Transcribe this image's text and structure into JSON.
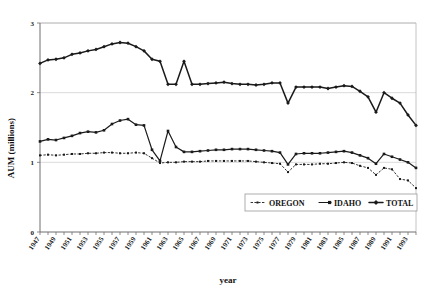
{
  "chart_data": {
    "type": "line",
    "title": "",
    "xlabel": "year",
    "ylabel": "AUM (millions)",
    "ylim": [
      0,
      3
    ],
    "yticks": [
      0,
      1,
      2,
      3
    ],
    "ytick_labels": [
      "0",
      "1",
      "2",
      "3"
    ],
    "grid": true,
    "legend_position": "inside-bottom-center",
    "x": [
      1947,
      1948,
      1949,
      1950,
      1951,
      1952,
      1953,
      1954,
      1955,
      1956,
      1957,
      1958,
      1959,
      1960,
      1961,
      1962,
      1963,
      1964,
      1965,
      1966,
      1967,
      1968,
      1969,
      1970,
      1971,
      1972,
      1973,
      1974,
      1975,
      1976,
      1977,
      1978,
      1979,
      1980,
      1981,
      1982,
      1983,
      1984,
      1985,
      1986,
      1987,
      1988,
      1989,
      1990,
      1991,
      1992,
      1993,
      1994
    ],
    "xtick_labels": [
      "1947",
      "1949",
      "1951",
      "1953",
      "1955",
      "1957",
      "1959",
      "1961",
      "1963",
      "1965",
      "1967",
      "1969",
      "1971",
      "1973",
      "1975",
      "1977",
      "1979",
      "1981",
      "1983",
      "1985",
      "1987",
      "1989",
      "1991",
      "1993"
    ],
    "xlim": [
      1947,
      1994
    ],
    "series": [
      {
        "name": "OREGON",
        "marker": "small-dot",
        "line_style": "dotted",
        "values": [
          1.1,
          1.11,
          1.1,
          1.11,
          1.12,
          1.12,
          1.13,
          1.13,
          1.14,
          1.14,
          1.13,
          1.13,
          1.14,
          1.13,
          1.06,
          0.99,
          1.0,
          1.0,
          1.01,
          1.01,
          1.01,
          1.02,
          1.02,
          1.02,
          1.02,
          1.02,
          1.02,
          1.01,
          1.0,
          0.99,
          0.98,
          0.86,
          0.97,
          0.97,
          0.97,
          0.98,
          0.98,
          0.99,
          1.0,
          0.99,
          0.95,
          0.92,
          0.82,
          0.92,
          0.9,
          0.76,
          0.74,
          0.63
        ]
      },
      {
        "name": "IDAHO",
        "marker": "square",
        "line_style": "solid",
        "values": [
          1.3,
          1.33,
          1.32,
          1.35,
          1.38,
          1.42,
          1.44,
          1.43,
          1.46,
          1.55,
          1.6,
          1.62,
          1.54,
          1.53,
          1.18,
          1.02,
          1.45,
          1.22,
          1.15,
          1.15,
          1.16,
          1.17,
          1.18,
          1.18,
          1.19,
          1.19,
          1.19,
          1.18,
          1.17,
          1.16,
          1.14,
          0.97,
          1.12,
          1.13,
          1.13,
          1.13,
          1.14,
          1.15,
          1.16,
          1.14,
          1.1,
          1.06,
          0.98,
          1.12,
          1.08,
          1.04,
          1.0,
          0.92
        ]
      },
      {
        "name": "TOTAL",
        "marker": "diamond",
        "line_style": "solid-bold",
        "values": [
          2.42,
          2.47,
          2.48,
          2.5,
          2.55,
          2.57,
          2.6,
          2.62,
          2.66,
          2.7,
          2.72,
          2.71,
          2.66,
          2.6,
          2.48,
          2.45,
          2.12,
          2.12,
          2.45,
          2.12,
          2.12,
          2.13,
          2.14,
          2.15,
          2.13,
          2.12,
          2.12,
          2.11,
          2.12,
          2.14,
          2.14,
          1.85,
          2.08,
          2.08,
          2.08,
          2.08,
          2.06,
          2.08,
          2.1,
          2.09,
          2.02,
          1.94,
          1.72,
          2.0,
          1.92,
          1.85,
          1.68,
          1.53
        ]
      }
    ]
  },
  "legend": {
    "items": [
      {
        "label": "OREGON"
      },
      {
        "label": "IDAHO"
      },
      {
        "label": "TOTAL"
      }
    ]
  },
  "colors": {
    "series": "#1a1a1a",
    "grid": "#d0d0d0",
    "axis": "#6e6e6e",
    "background": "#ffffff"
  }
}
